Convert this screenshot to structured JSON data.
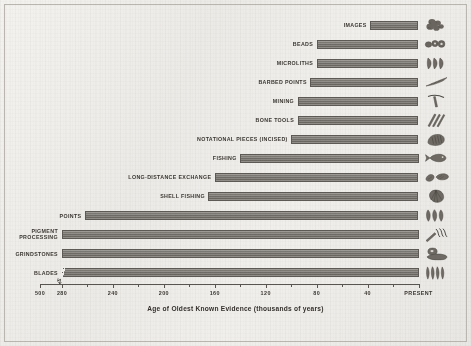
{
  "chart_data": {
    "type": "bar",
    "orientation": "horizontal",
    "title": "",
    "xlabel": "Age of Oldest Known Evidence (thousands of years)",
    "ylabel": "",
    "xlim": [
      500,
      0
    ],
    "x_axis_reversed": true,
    "axis_break": {
      "present": true,
      "between": [
        500,
        280
      ],
      "label_left": "500",
      "label_right": "280"
    },
    "grid": false,
    "legend": false,
    "tick_labels": [
      "500",
      "280",
      "240",
      "200",
      "160",
      "120",
      "80",
      "40",
      "PRESENT"
    ],
    "tick_values": [
      500,
      280,
      240,
      200,
      160,
      120,
      80,
      40,
      0
    ],
    "minor_tick_values": [
      260,
      220,
      180,
      140,
      100,
      60,
      20
    ],
    "value_units": "thousands of years ago",
    "categories": [
      "IMAGES",
      "BEADS",
      "MICROLITHS",
      "BARBED POINTS",
      "MINING",
      "BONE TOOLS",
      "NOTATIONAL PIECES (INCISED)",
      "FISHING",
      "LONG-DISTANCE EXCHANGE",
      "SHELL FISHING",
      "POINTS",
      "PIGMENT PROCESSING",
      "GRINDSTONES",
      "BLADES"
    ],
    "values": [
      38,
      80,
      80,
      85,
      95,
      95,
      100,
      140,
      160,
      165,
      262,
      285,
      285,
      285
    ],
    "series": [
      {
        "name": "Age of oldest known evidence",
        "values": [
          38,
          80,
          80,
          85,
          95,
          95,
          100,
          140,
          160,
          165,
          262,
          285,
          285,
          285
        ]
      }
    ],
    "bars": [
      {
        "label": "IMAGES",
        "value": 38,
        "icon": "figurine-icon",
        "label_lines": [
          "IMAGES"
        ],
        "has_break": false
      },
      {
        "label": "BEADS",
        "value": 80,
        "icon": "beads-icon",
        "label_lines": [
          "BEADS"
        ],
        "has_break": false
      },
      {
        "label": "MICROLITHS",
        "value": 80,
        "icon": "microliths-icon",
        "label_lines": [
          "MICROLITHS"
        ],
        "has_break": false
      },
      {
        "label": "BARBED POINTS",
        "value": 85,
        "icon": "barbed-point-icon",
        "label_lines": [
          "BARBED POINTS"
        ],
        "has_break": false
      },
      {
        "label": "MINING",
        "value": 95,
        "icon": "pick-axe-icon",
        "label_lines": [
          "MINING"
        ],
        "has_break": false
      },
      {
        "label": "BONE TOOLS",
        "value": 95,
        "icon": "bone-tools-icon",
        "label_lines": [
          "BONE TOOLS"
        ],
        "has_break": false
      },
      {
        "label": "NOTATIONAL PIECES (INCISED)",
        "value": 100,
        "icon": "incised-stone-icon",
        "label_lines": [
          "NOTATIONAL PIECES (INCISED)"
        ],
        "has_break": false
      },
      {
        "label": "FISHING",
        "value": 140,
        "icon": "fish-icon",
        "label_lines": [
          "FISHING"
        ],
        "has_break": false
      },
      {
        "label": "LONG-DISTANCE EXCHANGE",
        "value": 160,
        "icon": "exchange-shells-icon",
        "label_lines": [
          "LONG-DISTANCE EXCHANGE"
        ],
        "has_break": false
      },
      {
        "label": "SHELL FISHING",
        "value": 165,
        "icon": "shell-icon",
        "label_lines": [
          "SHELL FISHING"
        ],
        "has_break": false
      },
      {
        "label": "POINTS",
        "value": 262,
        "icon": "stone-points-icon",
        "label_lines": [
          "POINTS"
        ],
        "has_break": false
      },
      {
        "label": "PIGMENT PROCESSING",
        "value": 285,
        "icon": "pigment-icon",
        "label_lines": [
          "PIGMENT",
          "PROCESSING"
        ],
        "has_break": false
      },
      {
        "label": "GRINDSTONES",
        "value": 285,
        "icon": "grindstone-icon",
        "label_lines": [
          "GRINDSTONES"
        ],
        "has_break": false
      },
      {
        "label": "BLADES",
        "value": 285,
        "icon": "blades-icon",
        "label_lines": [
          "BLADES"
        ],
        "has_break": true
      }
    ]
  },
  "axis": {
    "title": "Age of Oldest Known Evidence (thousands of years)",
    "present_label": "PRESENT",
    "break_glyph": "↯"
  },
  "colors": {
    "background": "#efeeea",
    "bar_fill": "#77736d",
    "bar_stroke": "#5d5a55",
    "text": "#3a3732",
    "axis": "#58544f",
    "border": "#b9b6b0"
  }
}
